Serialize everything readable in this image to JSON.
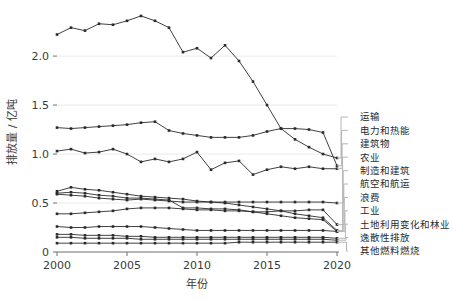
{
  "chart_data": {
    "type": "line",
    "title": "",
    "xlabel": "年份",
    "ylabel": "排放量 / 亿吨",
    "xlim": [
      2000,
      2020
    ],
    "ylim": [
      0,
      2.45
    ],
    "xticks": [
      2000,
      2005,
      2010,
      2015,
      2020
    ],
    "xticklabels": [
      "2000",
      "2005",
      "2010",
      "2015",
      "2020"
    ],
    "yticks": [
      0,
      0.5,
      1.0,
      1.5,
      2.0
    ],
    "yticklabels": [
      "0",
      "0.5",
      "1.0",
      "1.5",
      "2.0"
    ],
    "grid": true,
    "grid_axis": "y",
    "legend_position": "right-outside-leader-lines",
    "marker": "square",
    "line_color": "#2b2b2b",
    "x": [
      2000,
      2001,
      2002,
      2003,
      2004,
      2005,
      2006,
      2007,
      2008,
      2009,
      2010,
      2011,
      2012,
      2013,
      2014,
      2015,
      2016,
      2017,
      2018,
      2019,
      2020
    ],
    "series": [
      {
        "name": "运输",
        "values": [
          2.22,
          2.29,
          2.26,
          2.33,
          2.32,
          2.36,
          2.41,
          2.36,
          2.29,
          2.04,
          2.08,
          1.98,
          2.11,
          1.95,
          1.74,
          1.5,
          1.26,
          1.15,
          1.07,
          1.0,
          0.96
        ]
      },
      {
        "name": "电力和热能",
        "values": [
          1.27,
          1.26,
          1.27,
          1.28,
          1.29,
          1.3,
          1.32,
          1.33,
          1.24,
          1.21,
          1.19,
          1.17,
          1.17,
          1.17,
          1.19,
          1.23,
          1.26,
          1.26,
          1.25,
          1.22,
          0.88
        ]
      },
      {
        "name": "建筑物",
        "values": [
          1.03,
          1.05,
          1.01,
          1.02,
          1.05,
          1.0,
          0.92,
          0.95,
          0.92,
          0.95,
          1.02,
          0.84,
          0.91,
          0.93,
          0.79,
          0.84,
          0.87,
          0.85,
          0.87,
          0.85,
          0.85
        ]
      },
      {
        "name": "农业",
        "values": [
          0.62,
          0.66,
          0.64,
          0.63,
          0.61,
          0.59,
          0.57,
          0.56,
          0.55,
          0.54,
          0.52,
          0.51,
          0.5,
          0.48,
          0.46,
          0.44,
          0.42,
          0.39,
          0.37,
          0.35,
          0.22
        ]
      },
      {
        "name": "制造和建筑",
        "values": [
          0.6,
          0.61,
          0.6,
          0.58,
          0.57,
          0.55,
          0.55,
          0.54,
          0.53,
          0.45,
          0.45,
          0.44,
          0.44,
          0.43,
          0.41,
          0.39,
          0.37,
          0.35,
          0.34,
          0.33,
          0.21
        ]
      },
      {
        "name": "航空和航运",
        "values": [
          0.59,
          0.58,
          0.57,
          0.55,
          0.54,
          0.53,
          0.54,
          0.53,
          0.52,
          0.51,
          0.51,
          0.51,
          0.51,
          0.51,
          0.51,
          0.51,
          0.51,
          0.51,
          0.51,
          0.51,
          0.5
        ]
      },
      {
        "name": "浪费",
        "values": [
          0.39,
          0.39,
          0.4,
          0.41,
          0.42,
          0.44,
          0.45,
          0.45,
          0.45,
          0.44,
          0.43,
          0.43,
          0.42,
          0.42,
          0.41,
          0.41,
          0.42,
          0.42,
          0.43,
          0.43,
          0.28
        ]
      },
      {
        "name": "工业",
        "values": [
          0.26,
          0.25,
          0.25,
          0.26,
          0.26,
          0.26,
          0.26,
          0.25,
          0.24,
          0.23,
          0.22,
          0.22,
          0.22,
          0.22,
          0.22,
          0.22,
          0.22,
          0.22,
          0.22,
          0.22,
          0.21
        ]
      },
      {
        "name": "土地利用变化和林业",
        "values": [
          0.18,
          0.18,
          0.17,
          0.17,
          0.17,
          0.16,
          0.16,
          0.15,
          0.15,
          0.15,
          0.15,
          0.15,
          0.15,
          0.15,
          0.15,
          0.15,
          0.15,
          0.15,
          0.15,
          0.15,
          0.14
        ]
      },
      {
        "name": "逸散性排放",
        "values": [
          0.15,
          0.15,
          0.14,
          0.14,
          0.14,
          0.14,
          0.13,
          0.13,
          0.13,
          0.13,
          0.13,
          0.13,
          0.13,
          0.13,
          0.13,
          0.13,
          0.13,
          0.13,
          0.13,
          0.13,
          0.12
        ]
      },
      {
        "name": "其他燃料燃烧",
        "values": [
          0.09,
          0.09,
          0.09,
          0.09,
          0.09,
          0.09,
          0.09,
          0.09,
          0.09,
          0.09,
          0.09,
          0.09,
          0.09,
          0.1,
          0.1,
          0.1,
          0.1,
          0.1,
          0.1,
          0.1,
          0.1
        ]
      }
    ]
  }
}
